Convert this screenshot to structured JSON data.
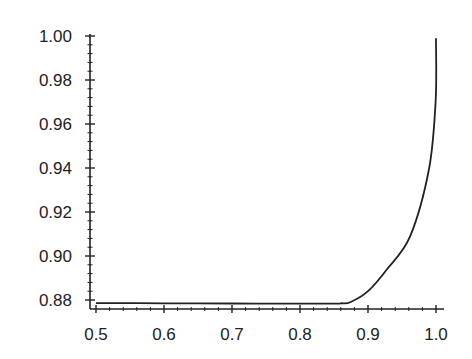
{
  "chart_data": {
    "type": "line",
    "title": "",
    "xlabel": "",
    "ylabel": "",
    "xlim": [
      0.5,
      1.0
    ],
    "ylim": [
      0.88,
      1.0
    ],
    "grid": false,
    "legend": null,
    "x_ticks": [
      "0.5",
      "0.6",
      "0.7",
      "0.8",
      "0.9",
      "1.0"
    ],
    "y_ticks": [
      "0.88",
      "0.90",
      "0.92",
      "0.94",
      "0.96",
      "0.98",
      "1.00"
    ],
    "series": [
      {
        "name": "curve",
        "color": "#222222",
        "x": [
          0.5,
          0.6,
          0.7,
          0.8,
          0.85,
          0.86,
          0.874,
          0.9,
          0.928,
          0.962,
          0.99,
          0.9995,
          1.0
        ],
        "y": [
          0.8786,
          0.8785,
          0.8784,
          0.8783,
          0.8783,
          0.8785,
          0.879,
          0.884,
          0.894,
          0.909,
          0.94,
          0.971,
          0.999
        ]
      }
    ]
  }
}
